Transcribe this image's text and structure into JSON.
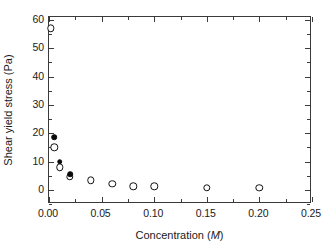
{
  "chart_data": {
    "type": "scatter",
    "title": "",
    "xlabel": "Concentration (M)",
    "xlabel_parts": {
      "text": "Concentration (",
      "italic": "M",
      "tail": ")"
    },
    "ylabel": "Shear yield stress (Pa)",
    "xlim": [
      0.0,
      0.25
    ],
    "ylim": [
      -5,
      61
    ],
    "xticks": [
      0.0,
      0.05,
      0.1,
      0.15,
      0.2,
      0.25
    ],
    "xticklabels": [
      "0.00",
      "0.05",
      "0.10",
      "0.15",
      "0.20",
      "0.25"
    ],
    "xminorticks": [
      0.025,
      0.075,
      0.125,
      0.175,
      0.225
    ],
    "yticks": [
      0,
      10,
      20,
      30,
      40,
      50,
      60
    ],
    "yticklabels": [
      "0",
      "10",
      "20",
      "30",
      "40",
      "50",
      "60"
    ],
    "yminorticks": [
      -5,
      5,
      15,
      25,
      35,
      45,
      55
    ],
    "grid": false,
    "legend": null,
    "frame": "box",
    "tick_direction": "in",
    "series": [
      {
        "name": "open-circles",
        "marker": "open-circle",
        "color": "#111111",
        "points": [
          {
            "x": 0.002,
            "y": 57.0
          },
          {
            "x": 0.005,
            "y": 15.0
          },
          {
            "x": 0.01,
            "y": 8.0
          },
          {
            "x": 0.02,
            "y": 4.7
          },
          {
            "x": 0.04,
            "y": 3.3
          },
          {
            "x": 0.06,
            "y": 2.1
          },
          {
            "x": 0.08,
            "y": 1.2
          },
          {
            "x": 0.1,
            "y": 1.2
          },
          {
            "x": 0.15,
            "y": 0.7
          },
          {
            "x": 0.2,
            "y": 0.7
          }
        ]
      },
      {
        "name": "filled-circles",
        "marker": "filled-circle",
        "color": "#0a0a0a",
        "points": [
          {
            "x": 0.005,
            "y": 18.5
          },
          {
            "x": 0.01,
            "y": 10.0
          },
          {
            "x": 0.02,
            "y": 5.5
          }
        ]
      }
    ]
  },
  "colors": {
    "axis": "#3a3a3a",
    "text": "#1a1a1a",
    "background": "#ffffff"
  }
}
